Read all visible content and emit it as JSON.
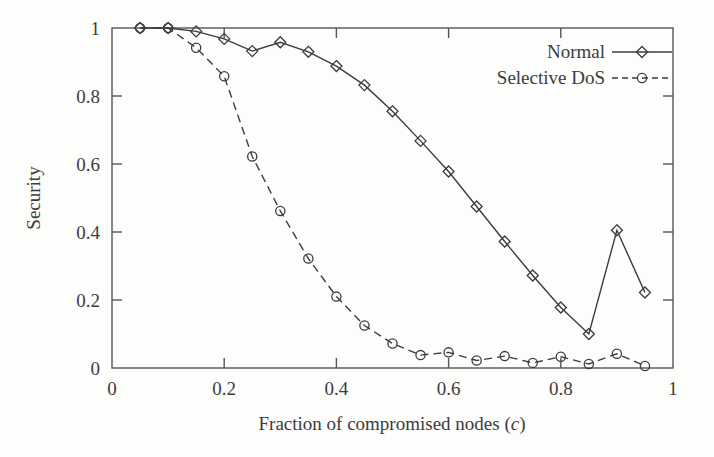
{
  "chart_data": {
    "type": "line",
    "title": "",
    "xlabel": "Fraction of compromised nodes (c)",
    "xlabel_plain": "Fraction of compromised nodes",
    "xlabel_variable": "c",
    "ylabel": "Security",
    "xlim": [
      0,
      1
    ],
    "ylim": [
      0,
      1
    ],
    "xticks": [
      0,
      0.2,
      0.4,
      0.6,
      0.8,
      1
    ],
    "xtick_labels": [
      "0",
      "0.2",
      "0.4",
      "0.6",
      "0.8",
      "1"
    ],
    "yticks": [
      0,
      0.2,
      0.4,
      0.6,
      0.8,
      1
    ],
    "ytick_labels": [
      "0",
      "0.2",
      "0.4",
      "0.6",
      "0.8",
      "1"
    ],
    "grid": false,
    "legend_position": "top-right",
    "x": [
      0.05,
      0.1,
      0.15,
      0.2,
      0.25,
      0.3,
      0.35,
      0.4,
      0.45,
      0.5,
      0.55,
      0.6,
      0.65,
      0.7,
      0.75,
      0.8,
      0.85,
      0.9,
      0.95
    ],
    "series": [
      {
        "name": "Normal",
        "marker": "diamond",
        "linestyle": "solid",
        "color": "#3c3c3c",
        "values": [
          1.0,
          1.0,
          0.99,
          0.968,
          0.932,
          0.958,
          0.93,
          0.888,
          0.832,
          0.755,
          0.668,
          0.578,
          0.475,
          0.372,
          0.272,
          0.178,
          0.1,
          0.405,
          0.222
        ]
      },
      {
        "name": "Selective DoS",
        "marker": "circle",
        "linestyle": "dashed",
        "color": "#3c3c3c",
        "values": [
          1.0,
          1.0,
          0.942,
          0.858,
          0.622,
          0.462,
          0.322,
          0.21,
          0.125,
          0.072,
          0.038,
          0.046,
          0.022,
          0.035,
          0.015,
          0.033,
          0.012,
          0.042,
          0.006
        ]
      }
    ]
  },
  "legend": {
    "entries": [
      {
        "label": "Normal",
        "linestyle": "solid",
        "marker": "diamond"
      },
      {
        "label": "Selective DoS",
        "linestyle": "dashed",
        "marker": "circle"
      }
    ]
  },
  "colors": {
    "line": "#3c3c3c",
    "axis": "#555555",
    "text": "#3c3c3c",
    "background": "#fdfdfc"
  }
}
